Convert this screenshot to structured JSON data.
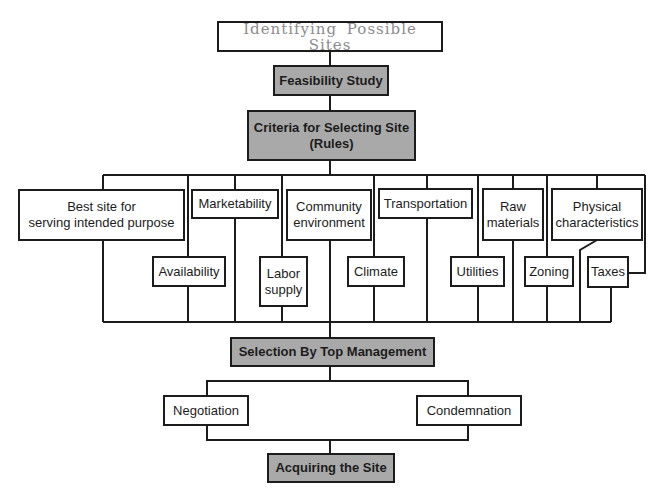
{
  "diagram": {
    "type": "flowchart",
    "colors": {
      "line": "#1c1c1c",
      "gray_fill": "#a9a9a9",
      "title_text": "#8c8c8c"
    },
    "nodes": {
      "identifying": "Identifying Possible Sites",
      "feasibility": "Feasibility Study",
      "criteria": "Criteria for Selecting Site\n(Rules)",
      "best_site": "Best site for\nserving intended purpose",
      "marketability": "Marketability",
      "community": "Community\nenvironment",
      "transportation": "Transportation",
      "raw_materials": "Raw\nmaterials",
      "physical": "Physical\ncharacteristics",
      "availability": "Availability",
      "labor": "Labor\nsupply",
      "climate": "Climate",
      "utilities": "Utilities",
      "zoning": "Zoning",
      "taxes": "Taxes",
      "selection": "Selection By Top Management",
      "negotiation": "Negotiation",
      "condemnation": "Condemnation",
      "acquiring": "Acquiring the Site"
    }
  }
}
